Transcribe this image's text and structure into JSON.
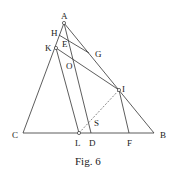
{
  "figure": {
    "caption": "Fig. 6",
    "points": {
      "A": {
        "label": "A",
        "x": 64,
        "y": 23
      },
      "H": {
        "label": "H",
        "x": 60,
        "y": 33
      },
      "K": {
        "label": "K",
        "x": 56,
        "y": 48
      },
      "E": {
        "label": "E",
        "x": 67,
        "y": 43
      },
      "G": {
        "label": "G",
        "x": 89,
        "y": 53
      },
      "O": {
        "label": "O",
        "x": 72,
        "y": 65
      },
      "I": {
        "label": "I",
        "x": 119,
        "y": 90
      },
      "S": {
        "label": "S",
        "x": 88,
        "y": 122
      },
      "C": {
        "label": "C",
        "x": 23,
        "y": 133
      },
      "L": {
        "label": "L",
        "x": 79,
        "y": 133
      },
      "D": {
        "label": "D",
        "x": 91,
        "y": 133
      },
      "F": {
        "label": "F",
        "x": 129,
        "y": 133
      },
      "B": {
        "label": "B",
        "x": 154,
        "y": 133
      }
    },
    "segments": [
      [
        "A",
        "C"
      ],
      [
        "A",
        "B"
      ],
      [
        "C",
        "B"
      ],
      [
        "A",
        "D"
      ],
      [
        "H",
        "G"
      ],
      [
        "K",
        "I"
      ],
      [
        "K",
        "L"
      ],
      [
        "I",
        "F"
      ]
    ],
    "dashed_segments": [
      [
        "L",
        "I"
      ]
    ],
    "marked_points": [
      "A",
      "K",
      "I",
      "L"
    ]
  }
}
